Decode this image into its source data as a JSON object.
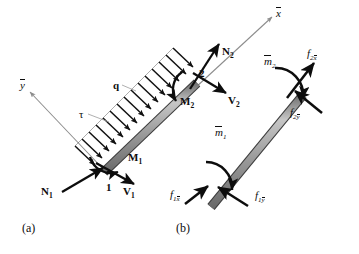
{
  "figure": {
    "panels": [
      {
        "id": "a",
        "caption": "(a)",
        "x": 22,
        "y": 222
      },
      {
        "id": "b",
        "caption": "(b)",
        "x": 176,
        "y": 222
      }
    ],
    "colors": {
      "ink": "#0d0d0d",
      "beam_fill": "#9a9a9a",
      "beam_edge": "#3a3a3a",
      "axis_line": "#8c8c8c",
      "leader_line": "#9c9c9c",
      "background": "#ffffff"
    }
  },
  "panel_a": {
    "axes": [
      {
        "name": "x-bar-axis",
        "label_base": "x",
        "overbar": true,
        "label_x": 276,
        "label_y": 8
      },
      {
        "name": "y-bar-axis",
        "label_base": "y",
        "overbar": true,
        "label_x": 20,
        "label_y": 80
      }
    ],
    "load": {
      "q_label": "q",
      "q_x": 113,
      "q_y": 80,
      "tau_label": "τ",
      "tau_x": 79,
      "tau_y": 109
    },
    "nodes": [
      {
        "name": "node-1",
        "label": "1",
        "x": 106,
        "y": 182
      },
      {
        "name": "node-2",
        "label": "2",
        "x": 199,
        "y": 68
      }
    ],
    "forces": [
      {
        "name": "axial-force-N1",
        "base": "N",
        "sub": "1",
        "x": 41,
        "y": 186
      },
      {
        "name": "shear-force-V1",
        "base": "V",
        "sub": "1",
        "x": 123,
        "y": 186
      },
      {
        "name": "moment-M1",
        "base": "M",
        "sub": "1",
        "x": 128,
        "y": 152
      },
      {
        "name": "axial-force-N2",
        "base": "N",
        "sub": "2",
        "x": 222,
        "y": 46
      },
      {
        "name": "shear-force-V2",
        "base": "V",
        "sub": "2",
        "x": 228,
        "y": 95
      },
      {
        "name": "moment-M2",
        "base": "M",
        "sub": "2",
        "x": 180,
        "y": 96
      }
    ]
  },
  "panel_b": {
    "nodal_forces": [
      {
        "name": "force-f1xbar",
        "base": "f",
        "sub_base": "1",
        "sub_over": "x",
        "x": 170,
        "y": 189
      },
      {
        "name": "force-f1ybar",
        "base": "f",
        "sub_base": "1",
        "sub_over": "y",
        "x": 255,
        "y": 190
      },
      {
        "name": "moment-m1bar",
        "base": "m",
        "sub": "1",
        "overbar": true,
        "x": 215,
        "y": 127
      },
      {
        "name": "force-f2xbar",
        "base": "f",
        "sub_base": "2",
        "sub_over": "x",
        "x": 307,
        "y": 48
      },
      {
        "name": "force-f2ybar",
        "base": "f",
        "sub_base": "2",
        "sub_over": "y",
        "x": 290,
        "y": 107
      },
      {
        "name": "moment-m2bar",
        "base": "m",
        "sub": "2",
        "overbar": true,
        "x": 264,
        "y": 56
      }
    ]
  }
}
